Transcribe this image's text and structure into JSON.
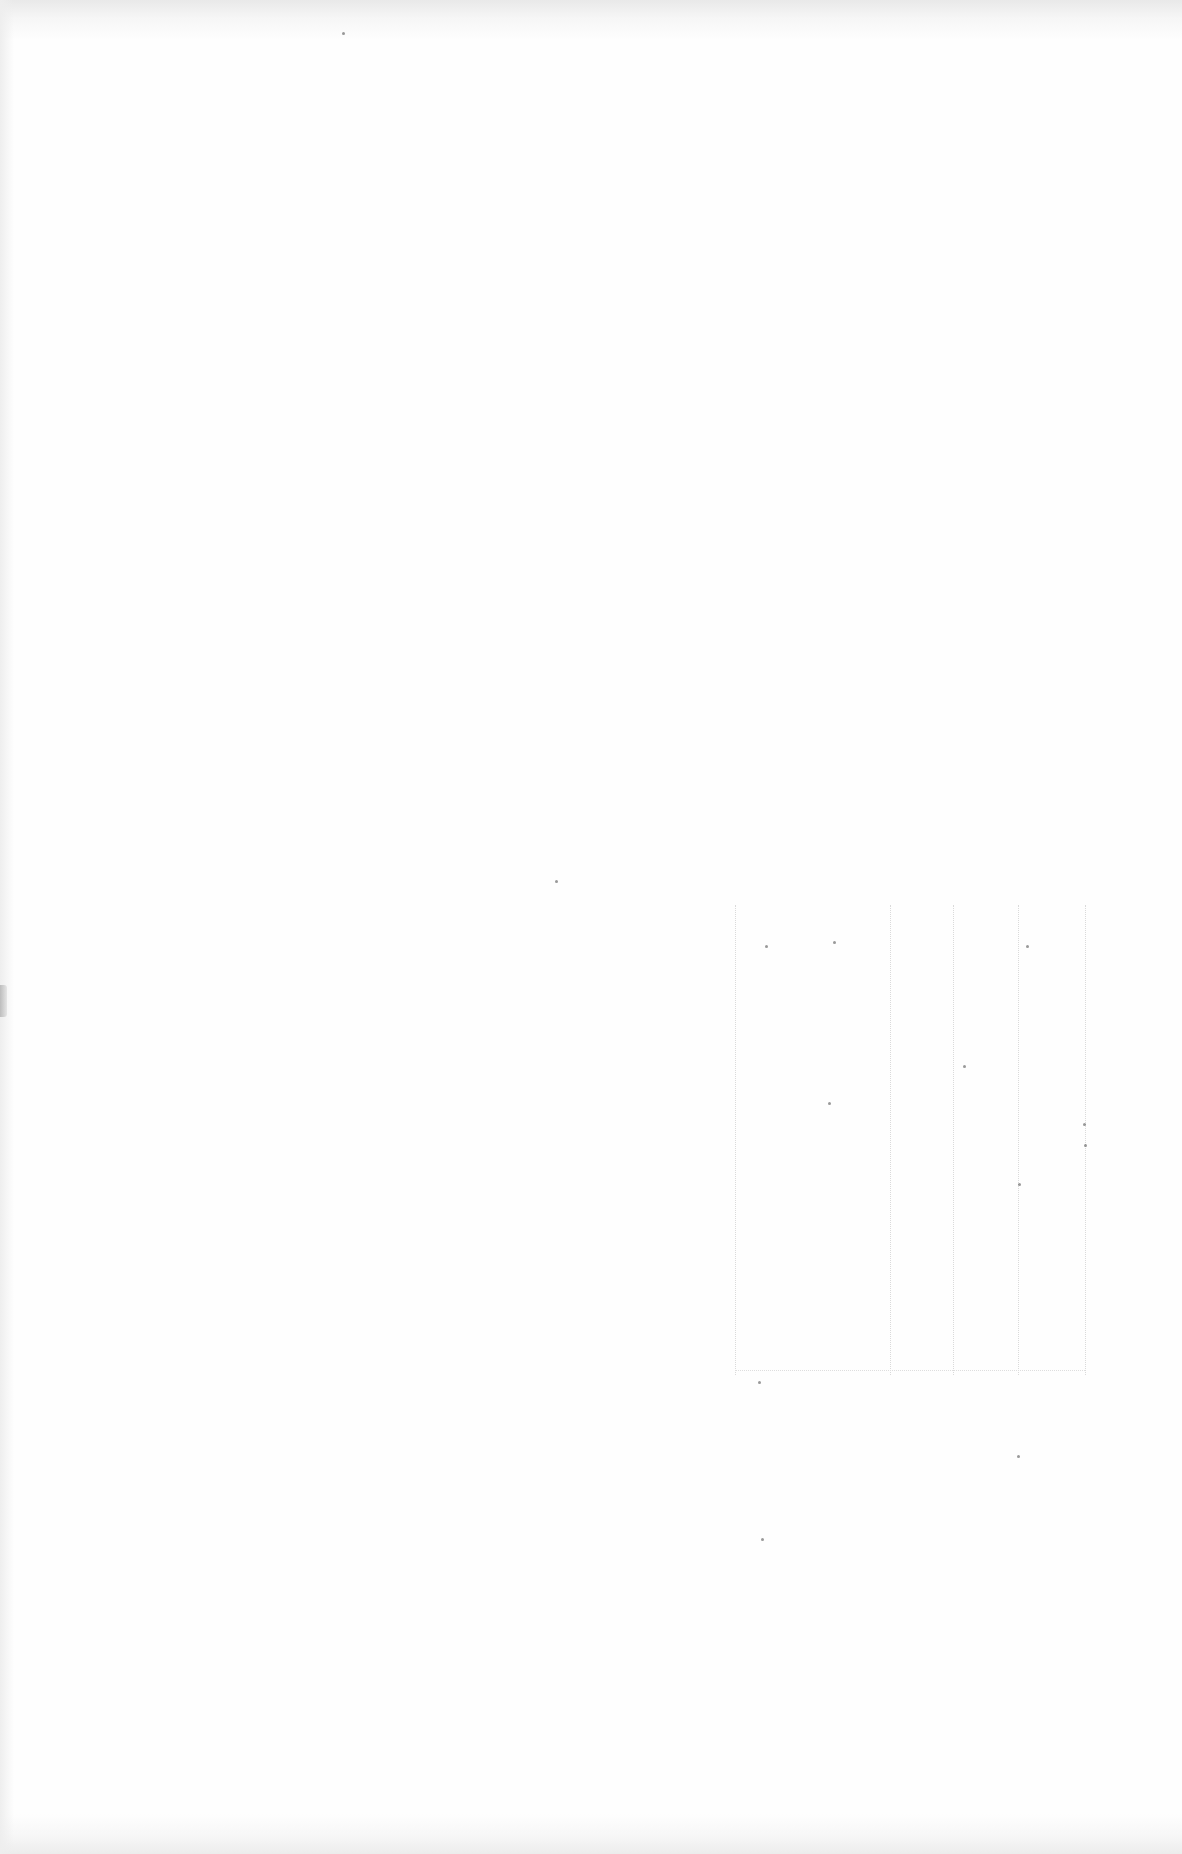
{
  "document": {
    "type": "scanned-page",
    "visible_text": "",
    "page_background": "#fefefe"
  }
}
